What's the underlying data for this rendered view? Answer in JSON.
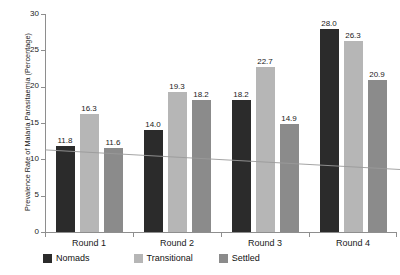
{
  "chart_data": {
    "type": "bar",
    "title": "",
    "subtitle": "",
    "xlabel": "",
    "ylabel": "Prevalence Rate of Malaria Parasitaemia (Percentage)",
    "categories": [
      "Round 1",
      "Round 2",
      "Round 3",
      "Round 4"
    ],
    "series": [
      {
        "name": "Nomads",
        "color": "#2b2b2b",
        "values": [
          11.8,
          14.0,
          18.2,
          28.0
        ],
        "labels": [
          "11.8",
          "14.0",
          "18.2",
          "28.0"
        ]
      },
      {
        "name": "Transitional",
        "color": "#b6b6b6",
        "values": [
          16.3,
          19.3,
          22.7,
          26.3
        ],
        "labels": [
          "16.3",
          "19.3",
          "22.7",
          "26.3"
        ]
      },
      {
        "name": "Settled",
        "color": "#8b8b8b",
        "values": [
          11.6,
          18.2,
          14.9,
          20.9
        ],
        "labels": [
          "11.6",
          "18.2",
          "14.9",
          "20.9"
        ]
      }
    ],
    "ylim": [
      0,
      30
    ],
    "yticks": [
      0,
      5,
      10,
      15,
      20,
      25,
      30
    ],
    "ytick_labels": [
      "0",
      "5",
      "10",
      "15",
      "20",
      "25",
      "30"
    ],
    "grid": false,
    "legend_position": "bottom-left",
    "trendline": {
      "name": "trend",
      "color": "#9a9a9a",
      "start_value": 11.3,
      "end_value": 8.6
    }
  },
  "legend": {
    "items": [
      {
        "label": "Nomads",
        "color": "#2b2b2b"
      },
      {
        "label": "Transitional",
        "color": "#b6b6b6"
      },
      {
        "label": "Settled",
        "color": "#8b8b8b"
      }
    ]
  },
  "axes": {
    "y_title": "Prevalence Rate of Malaria Parasitaemia (Percentage)",
    "y_ticks": [
      "0",
      "5",
      "10",
      "15",
      "20",
      "25",
      "30"
    ],
    "x_categories": [
      "Round 1",
      "Round 2",
      "Round 3",
      "Round 4"
    ]
  }
}
